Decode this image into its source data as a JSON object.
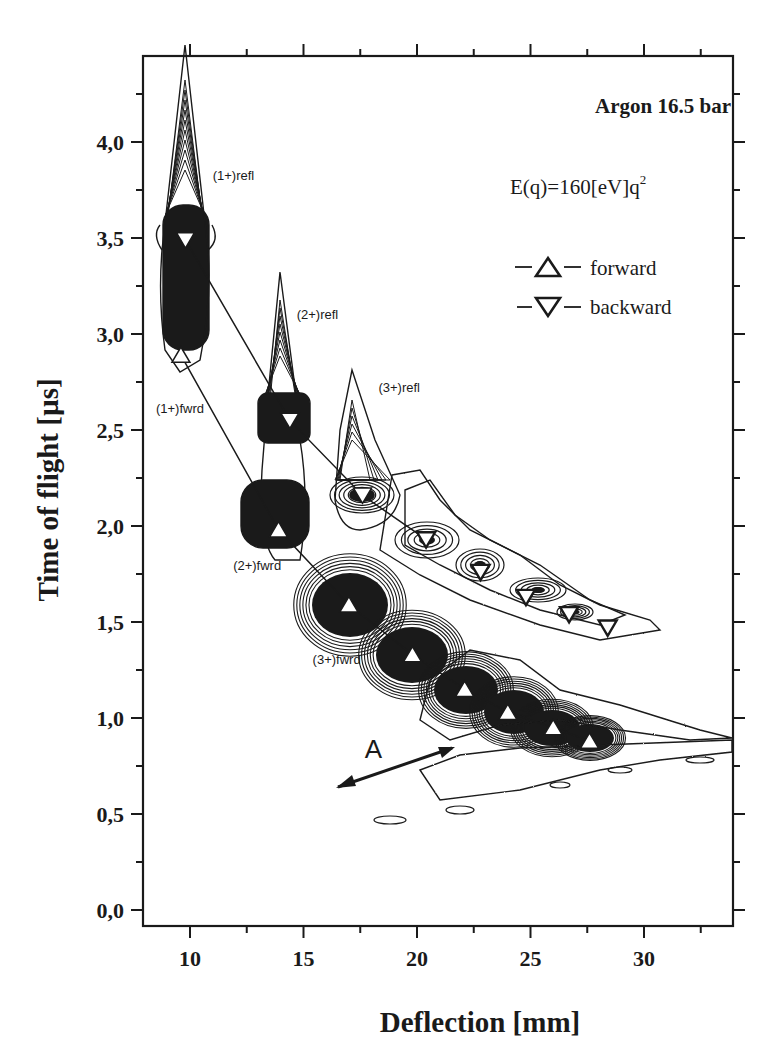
{
  "chart_data": {
    "type": "scatter",
    "title": "Argon 16.5 bar",
    "subtitle": "E(q)=160[eV]q²",
    "xlabel": "Deflection [mm]",
    "ylabel": "Time of flight [µs]",
    "xlim": [
      8,
      34.5
    ],
    "ylim": [
      -0.1,
      4.6
    ],
    "xticks": [
      10,
      15,
      20,
      25,
      30
    ],
    "xtick_labels": [
      "10",
      "15",
      "20",
      "25",
      "30"
    ],
    "yticks": [
      0.0,
      0.5,
      1.0,
      1.5,
      2.0,
      2.5,
      3.0,
      3.5,
      4.0
    ],
    "ytick_labels": [
      "0,0",
      "0,5",
      "1,0",
      "1,5",
      "2,0",
      "2,5",
      "3,0",
      "3,5",
      "4,0"
    ],
    "grid": false,
    "legend_position": "upper right",
    "series": [
      {
        "name": "forward",
        "marker": "triangle-up",
        "x": [
          9.6,
          13.9,
          17.0,
          19.8,
          22.1,
          24.0,
          26.0,
          27.6
        ],
        "y": [
          2.89,
          1.98,
          1.59,
          1.33,
          1.15,
          1.03,
          0.95,
          0.88
        ]
      },
      {
        "name": "backward",
        "marker": "triangle-down",
        "x": [
          9.8,
          14.4,
          17.6,
          20.4,
          22.8,
          24.8,
          26.7,
          28.4
        ],
        "y": [
          3.49,
          2.55,
          2.16,
          1.93,
          1.76,
          1.63,
          1.54,
          1.47
        ]
      }
    ],
    "annotations": [
      {
        "text": "(1+)refl",
        "x": 11.0,
        "y": 3.8
      },
      {
        "text": "(2+)refl",
        "x": 14.7,
        "y": 3.08
      },
      {
        "text": "(3+)refl",
        "x": 18.3,
        "y": 2.7
      },
      {
        "text": "(1+)fwrd",
        "x": 8.5,
        "y": 2.59
      },
      {
        "text": "(2+)fwrd",
        "x": 11.9,
        "y": 1.77
      },
      {
        "text": "(3+)fwrd",
        "x": 15.4,
        "y": 1.28
      },
      {
        "text": "A",
        "x": 17.7,
        "y": 0.79
      }
    ],
    "plot_style": "contour plot of ion counts with overlaid peak markers"
  },
  "legend": {
    "title": "Argon 16.5 bar",
    "formula": "E(q)=160[eV]q",
    "formula_sup": "2",
    "forward_label": "forward",
    "backward_label": "backward"
  },
  "axes": {
    "xlabel": "Deflection [mm]",
    "ylabel": "Time of flight [µs]"
  }
}
